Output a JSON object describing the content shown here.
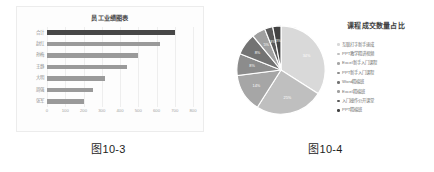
{
  "figures": [
    {
      "caption": "图10-3",
      "chart_data": {
        "type": "bar",
        "orientation": "horizontal",
        "title": "员工业绩图表",
        "categories": [
          "合计",
          "赵红",
          "孙梅",
          "王静",
          "大明",
          "周强",
          "张军"
        ],
        "values": [
          700,
          620,
          500,
          440,
          320,
          250,
          200
        ],
        "xlabel": "",
        "ylabel": "",
        "xlim": [
          0,
          800
        ],
        "xticks": [
          "0",
          "100",
          "200",
          "300",
          "400",
          "500",
          "600",
          "700",
          "800"
        ],
        "grid": true,
        "legend": "none",
        "bar_colors": [
          "#474747",
          "#9a9a9a",
          "#9a9a9a",
          "#9a9a9a",
          "#9a9a9a",
          "#9a9a9a",
          "#9a9a9a"
        ]
      }
    },
    {
      "caption": "图10-4",
      "chart_data": {
        "type": "pie",
        "title": "课程成交数量占比",
        "labels": [
          "互联打字新手速成",
          "PPT教学精讲视频",
          "Excel新手入门课程",
          "PPT新手入门课程",
          "Word精编班",
          "Excel精编班",
          "入门操作公开课堂",
          "PPT精编班"
        ],
        "values": [
          34,
          25,
          14,
          8,
          8,
          5,
          3,
          3
        ],
        "value_labels": [
          "34%",
          "25%",
          "14%",
          "8%",
          "8%",
          "5%",
          "3%",
          "3%"
        ],
        "colors": [
          "#d9d9d9",
          "#bfbfbf",
          "#a6a6a6",
          "#8c8c8c",
          "#737373",
          "#a0a0a0",
          "#5a5a5a",
          "#424242"
        ],
        "legend": "right"
      }
    }
  ]
}
